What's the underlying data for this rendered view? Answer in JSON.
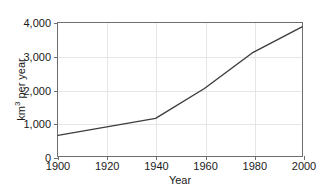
{
  "chart_data": {
    "type": "line",
    "title": "",
    "xlabel": "Year",
    "ylabel": "km3 per year",
    "ylabel_display": "km",
    "ylabel_sup": "3",
    "ylabel_rest": " per year",
    "x": [
      1900,
      1940,
      1960,
      1980,
      2000
    ],
    "values": [
      620,
      1130,
      2030,
      3120,
      3880
    ],
    "series": [
      {
        "name": "Global water withdrawal",
        "values": [
          620,
          1130,
          2030,
          3120,
          3880
        ]
      }
    ],
    "xlim": [
      1900,
      2000
    ],
    "ylim": [
      0,
      4000
    ],
    "xticks": [
      1900,
      1920,
      1940,
      1960,
      1980,
      2000
    ],
    "xtick_labels": [
      "1900",
      "1920",
      "1940",
      "1960",
      "1980",
      "2000"
    ],
    "yticks": [
      0,
      1000,
      2000,
      3000,
      4000
    ],
    "ytick_labels": [
      "0",
      "1,000",
      "2,000",
      "3,000",
      "4,000"
    ],
    "grid": true,
    "legend": "none",
    "line_color": "#3d3d3d",
    "grid_color": "#e6e6e6",
    "axis_color": "#6e6e6e",
    "background_color": "#ffffff"
  }
}
